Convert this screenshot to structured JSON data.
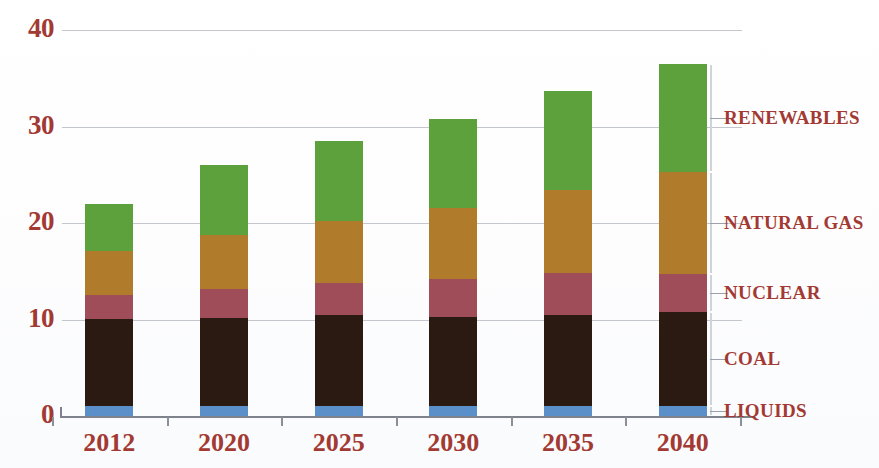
{
  "figure": {
    "frame_border_color": "#13161c",
    "background": "#fefefe",
    "tick_text_color": "#a23a33",
    "gridline_color": "#b9bcc4"
  },
  "axis": {
    "y_ticks": [
      "0",
      "10",
      "20",
      "30",
      "40"
    ],
    "y_tick_values": [
      0,
      10,
      20,
      30,
      40
    ],
    "x_ticks": [
      "2012",
      "2020",
      "2025",
      "2030",
      "2035",
      "2040"
    ]
  },
  "legend": {
    "items": [
      {
        "key": "renewables",
        "label": "RENEWABLES",
        "color": "#5da13c"
      },
      {
        "key": "natural_gas",
        "label": "NATURAL GAS",
        "color": "#b07b2b"
      },
      {
        "key": "nuclear",
        "label": "NUCLEAR",
        "color": "#9e4d59"
      },
      {
        "key": "coal",
        "label": "COAL",
        "color": "#2b1a11"
      },
      {
        "key": "liquids",
        "label": "LIQUIDS",
        "color": "#5b8fc9"
      }
    ]
  },
  "chart_data": {
    "type": "bar",
    "stacked": true,
    "title": "",
    "subtitle": "",
    "xlabel": "",
    "ylabel": "",
    "ylim": [
      0,
      40
    ],
    "yticks": [
      0,
      10,
      20,
      30,
      40
    ],
    "grid": true,
    "legend_position": "right-inline",
    "categories": [
      "2012",
      "2020",
      "2025",
      "2030",
      "2035",
      "2040"
    ],
    "series": [
      {
        "name": "LIQUIDS",
        "color": "#5b8fc9",
        "values": [
          1.0,
          1.0,
          1.0,
          1.0,
          1.0,
          1.0
        ]
      },
      {
        "name": "COAL",
        "color": "#2b1a11",
        "values": [
          9.1,
          9.2,
          9.5,
          9.3,
          9.5,
          9.8
        ]
      },
      {
        "name": "NUCLEAR",
        "color": "#9e4d59",
        "values": [
          2.4,
          3.0,
          3.3,
          3.9,
          4.3,
          3.9
        ]
      },
      {
        "name": "NATURAL GAS",
        "color": "#b07b2b",
        "values": [
          4.6,
          5.6,
          6.4,
          7.4,
          8.6,
          10.6
        ]
      },
      {
        "name": "RENEWABLES",
        "color": "#5da13c",
        "values": [
          4.9,
          7.2,
          8.3,
          9.2,
          10.3,
          11.2
        ]
      }
    ],
    "totals": [
      22.0,
      26.0,
      28.5,
      30.8,
      33.7,
      36.5
    ]
  }
}
